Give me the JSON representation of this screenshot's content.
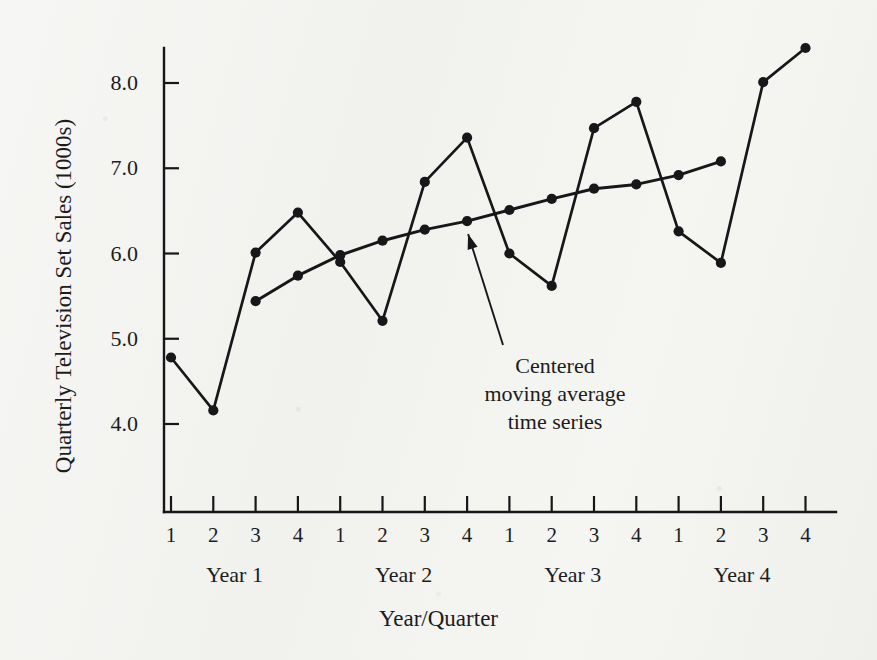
{
  "figure": {
    "background_color": "#f4f4f2",
    "ink_color": "#17171a"
  },
  "axes": {
    "y_title": "Quarterly Television Set Sales (1000s)",
    "x_title": "Year/Quarter",
    "y_ticks": [
      "4.0",
      "5.0",
      "6.0",
      "7.0",
      "8.0"
    ],
    "x_tick_labels": [
      "1",
      "2",
      "3",
      "4",
      "1",
      "2",
      "3",
      "4",
      "1",
      "2",
      "3",
      "4",
      "1",
      "2",
      "3",
      "4"
    ],
    "group_labels": [
      "Year 1",
      "Year 2",
      "Year 3",
      "Year 4"
    ]
  },
  "annotation": {
    "line1": "Centered",
    "line2": "moving average",
    "line3": "time series"
  },
  "chart_data": {
    "type": "line",
    "title": "",
    "xlabel": "Year/Quarter",
    "ylabel": "Quarterly Television Set Sales (1000s)",
    "x": [
      1,
      2,
      3,
      4,
      5,
      6,
      7,
      8,
      9,
      10,
      11,
      12,
      13,
      14,
      15,
      16
    ],
    "categories": [
      "Y1 Q1",
      "Y1 Q2",
      "Y1 Q3",
      "Y1 Q4",
      "Y2 Q1",
      "Y2 Q2",
      "Y2 Q3",
      "Y2 Q4",
      "Y3 Q1",
      "Y3 Q2",
      "Y3 Q3",
      "Y3 Q4",
      "Y4 Q1",
      "Y4 Q2",
      "Y4 Q3",
      "Y4 Q4"
    ],
    "ylim": [
      3.3,
      8.75
    ],
    "xlim": [
      0.6,
      16.4
    ],
    "grid": false,
    "legend": "none",
    "series": [
      {
        "name": "Quarterly television set sales",
        "marker": "filled-circle",
        "values": [
          4.78,
          4.16,
          6.01,
          6.48,
          5.9,
          5.21,
          6.84,
          7.36,
          6.0,
          5.62,
          7.47,
          7.78,
          6.26,
          5.89,
          8.01,
          8.41
        ],
        "x": [
          1,
          2,
          3,
          4,
          5,
          6,
          7,
          8,
          9,
          10,
          11,
          12,
          13,
          14,
          15,
          16
        ]
      },
      {
        "name": "Centered moving average time series",
        "marker": "filled-circle",
        "values": [
          5.44,
          5.74,
          5.98,
          6.15,
          6.28,
          6.38,
          6.51,
          6.64,
          6.76,
          6.81,
          6.92,
          7.08
        ],
        "x": [
          3,
          4,
          5,
          6,
          7,
          8,
          9,
          10,
          11,
          12,
          13,
          14
        ]
      }
    ]
  }
}
